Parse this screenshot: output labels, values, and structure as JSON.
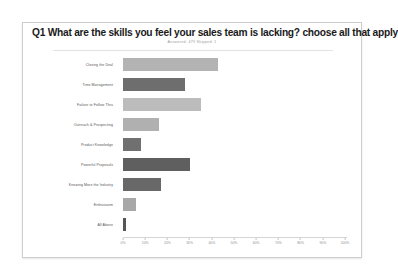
{
  "card": {
    "question_number": "Q1",
    "title": "What are the skills you feel your sales team is lacking? choose all that apply",
    "subtitle": "Answered: 479   Skipped: 1"
  },
  "chart_data": {
    "type": "bar",
    "orientation": "horizontal",
    "title": "Q1 What are the skills you feel your sales team is lacking? choose all that apply",
    "xlabel": "",
    "ylabel": "",
    "xlim": [
      0,
      100
    ],
    "grid": false,
    "legend": "none",
    "categories": [
      "Closing the Deal",
      "Time Management",
      "Failure to Follow Thru",
      "Outreach & Prospecting",
      "Product Knowledge",
      "Powerful Proposals",
      "Knowing More the Industry",
      "Enthusiasm",
      "All Above"
    ],
    "values": [
      43,
      28,
      35,
      16,
      8,
      30,
      17,
      6,
      1.5
    ],
    "colors": [
      "#b3b3b3",
      "#6e6e6e",
      "#bcbcbc",
      "#b0b0b0",
      "#707070",
      "#5f5f5f",
      "#686868",
      "#a8a8a8",
      "#565656"
    ],
    "tick_labels": [
      "0%",
      "10%",
      "20%",
      "30%",
      "40%",
      "50%",
      "60%",
      "70%",
      "80%",
      "90%",
      "100%"
    ],
    "tick_values": [
      0,
      10,
      20,
      30,
      40,
      50,
      60,
      70,
      80,
      90,
      100
    ]
  }
}
